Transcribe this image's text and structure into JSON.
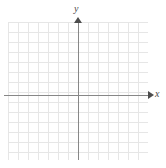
{
  "figure": {
    "type": "blank-coordinate-plane",
    "background_color": "#ffffff",
    "grid": {
      "visible": true,
      "line_color": "#e6e6e6",
      "cell_size_px": 10,
      "columns": 14,
      "rows": 14
    },
    "axes": {
      "color": "#878787",
      "arrow_color": "#4d4d4d",
      "x": {
        "label": "x",
        "arrow": "right",
        "origin_y_px": 95
      },
      "y": {
        "label": "y",
        "arrow": "up",
        "origin_x_px": 78
      }
    },
    "tick_labels": [],
    "plotted_data": []
  },
  "chart_data": {
    "type": "scatter",
    "title": "",
    "xlabel": "x",
    "ylabel": "y",
    "x": [],
    "y": [],
    "series": [],
    "xlim": [
      -7,
      7
    ],
    "ylim": [
      -6.5,
      7.5
    ],
    "xticks": [],
    "yticks": [],
    "grid": true,
    "legend": null,
    "annotations": []
  }
}
